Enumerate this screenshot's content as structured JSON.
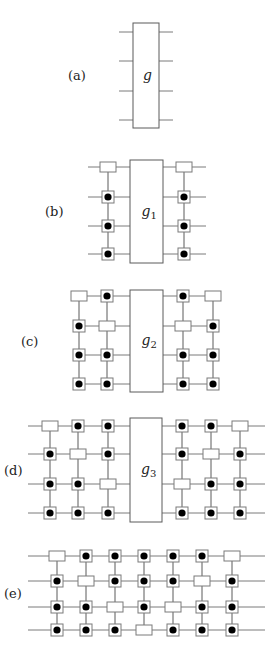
{
  "figure": {
    "width": 275,
    "height": 650,
    "colors": {
      "wire": "#7a7a7a",
      "box_stroke": "#5a5a5a",
      "dot": "#000000",
      "background": "#ffffff"
    },
    "legend": {
      "rect": "empty rectangle node",
      "dot": "square with filled black dot node"
    },
    "panels": [
      {
        "id": "a",
        "label": "(a)",
        "label_pos": [
          68,
          80
        ],
        "gate": {
          "name": "g",
          "subscript": "",
          "x": 133,
          "y": 23,
          "w": 26,
          "h": 105
        },
        "rows_y": [
          32,
          61,
          91,
          120
        ],
        "wire_x": [
          119,
          173
        ],
        "columns_x": [],
        "grid": []
      },
      {
        "id": "b",
        "label": "(b)",
        "label_pos": [
          45,
          216
        ],
        "gate": {
          "name": "g",
          "subscript": "1",
          "x": 130,
          "y": 160,
          "w": 33,
          "h": 103
        },
        "rows_y": [
          167,
          197,
          226,
          254
        ],
        "wire_x": [
          88,
          206
        ],
        "columns_x": [
          108,
          184
        ],
        "grid": [
          [
            "rect",
            "rect"
          ],
          [
            "dot",
            "dot"
          ],
          [
            "dot",
            "dot"
          ],
          [
            "dot",
            "dot"
          ]
        ]
      },
      {
        "id": "c",
        "label": "(c)",
        "label_pos": [
          21,
          346
        ],
        "gate": {
          "name": "g",
          "subscript": "2",
          "x": 130,
          "y": 290,
          "w": 33,
          "h": 102
        },
        "rows_y": [
          296,
          326,
          355,
          384
        ],
        "wire_x": [
          79,
          213
        ],
        "columns_x": [
          79,
          107,
          183,
          213
        ],
        "grid": [
          [
            "rect",
            "dot",
            "dot",
            "rect"
          ],
          [
            "dot",
            "rect",
            "rect",
            "dot"
          ],
          [
            "dot",
            "dot",
            "dot",
            "dot"
          ],
          [
            "dot",
            "dot",
            "dot",
            "dot"
          ]
        ]
      },
      {
        "id": "d",
        "label": "(d)",
        "label_pos": [
          4,
          475
        ],
        "gate": {
          "name": "g",
          "subscript": "3",
          "x": 130,
          "y": 418,
          "w": 32,
          "h": 104
        },
        "rows_y": [
          426,
          454,
          484,
          513
        ],
        "wire_x": [
          28,
          265
        ],
        "columns_x": [
          50,
          78,
          108,
          182,
          211,
          240
        ],
        "grid": [
          [
            "rect",
            "dot",
            "dot",
            "dot",
            "dot",
            "rect"
          ],
          [
            "dot",
            "rect",
            "dot",
            "dot",
            "rect",
            "dot"
          ],
          [
            "dot",
            "dot",
            "rect",
            "rect",
            "dot",
            "dot"
          ],
          [
            "dot",
            "dot",
            "dot",
            "dot",
            "dot",
            "dot"
          ]
        ]
      },
      {
        "id": "e",
        "label": "(e)",
        "label_pos": [
          4,
          598
        ],
        "gate": null,
        "rows_y": [
          556,
          581,
          607,
          630
        ],
        "wire_x": [
          28,
          265
        ],
        "columns_x": [
          57,
          86,
          115,
          144,
          173,
          202,
          232
        ],
        "grid": [
          [
            "rect",
            "dot",
            "dot",
            "dot",
            "dot",
            "dot",
            "rect"
          ],
          [
            "dot",
            "rect",
            "dot",
            "dot",
            "dot",
            "rect",
            "dot"
          ],
          [
            "dot",
            "dot",
            "rect",
            "dot",
            "rect",
            "dot",
            "dot"
          ],
          [
            "dot",
            "dot",
            "dot",
            "rect",
            "dot",
            "dot",
            "dot"
          ]
        ]
      }
    ]
  }
}
